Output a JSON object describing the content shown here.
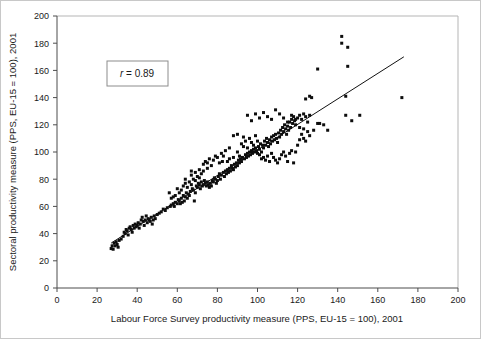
{
  "chart_data": {
    "type": "scatter",
    "title": "",
    "xlabel": "Labour Force Survey productivity measure (PPS, EU-15 = 100), 2001",
    "ylabel": "Sectoral productivity measure (PPS, EU-15 = 100), 2001",
    "xlim": [
      0,
      200
    ],
    "ylim": [
      0,
      200
    ],
    "xticks": [
      0,
      20,
      40,
      60,
      80,
      100,
      120,
      140,
      160,
      180,
      200
    ],
    "yticks": [
      0,
      20,
      40,
      60,
      80,
      100,
      120,
      140,
      160,
      180,
      200
    ],
    "grid": false,
    "legend": null,
    "annotations": [
      {
        "name": "correlation-box",
        "text": "r = 0.89",
        "italic_part": "r",
        "rest": " = 0.89",
        "x": 38,
        "y": 172
      }
    ],
    "marker": {
      "shape": "square",
      "size_px": 3,
      "color": "#0d0d0d"
    },
    "fit_line": {
      "type": "linear",
      "color": "#111111",
      "x_start": 27,
      "y_start": 33,
      "x_end": 173,
      "y_end": 170
    },
    "series": [
      {
        "name": "regions",
        "points": [
          [
            27,
            29
          ],
          [
            27.5,
            31
          ],
          [
            28,
            28.5
          ],
          [
            28.5,
            33
          ],
          [
            29,
            31
          ],
          [
            29.5,
            34
          ],
          [
            30,
            32
          ],
          [
            30.5,
            30
          ],
          [
            31,
            35
          ],
          [
            32,
            36
          ],
          [
            33,
            38
          ],
          [
            33.5,
            41
          ],
          [
            34,
            40
          ],
          [
            34.5,
            43
          ],
          [
            35,
            42
          ],
          [
            35.5,
            39
          ],
          [
            36,
            44
          ],
          [
            36.5,
            45
          ],
          [
            37,
            43
          ],
          [
            37.5,
            41
          ],
          [
            38,
            46
          ],
          [
            38.5,
            44
          ],
          [
            39,
            47
          ],
          [
            39.5,
            45
          ],
          [
            40,
            46
          ],
          [
            40.5,
            48
          ],
          [
            41,
            44
          ],
          [
            41.5,
            47
          ],
          [
            42,
            50
          ],
          [
            42.5,
            52
          ],
          [
            43,
            49
          ],
          [
            43.5,
            46
          ],
          [
            44,
            50
          ],
          [
            44.5,
            53
          ],
          [
            45,
            48
          ],
          [
            45.5,
            51
          ],
          [
            46,
            50
          ],
          [
            46.5,
            49
          ],
          [
            47,
            52
          ],
          [
            47.5,
            47
          ],
          [
            48,
            50
          ],
          [
            48.5,
            53
          ],
          [
            49,
            51
          ],
          [
            50,
            54
          ],
          [
            51,
            55
          ],
          [
            52,
            56
          ],
          [
            53,
            58
          ],
          [
            54,
            57
          ],
          [
            55,
            59
          ],
          [
            56,
            70
          ],
          [
            56.5,
            60
          ],
          [
            57,
            61
          ],
          [
            58,
            62
          ],
          [
            58.5,
            60
          ],
          [
            59,
            63
          ],
          [
            60,
            62
          ],
          [
            60.5,
            65
          ],
          [
            61,
            64
          ],
          [
            61.5,
            62
          ],
          [
            62,
            66
          ],
          [
            62.5,
            63
          ],
          [
            63,
            68
          ],
          [
            63.5,
            64
          ],
          [
            64,
            67
          ],
          [
            64.5,
            70
          ],
          [
            65,
            66
          ],
          [
            65.5,
            69
          ],
          [
            66,
            68
          ],
          [
            66.5,
            71
          ],
          [
            67,
            86
          ],
          [
            67.5,
            73
          ],
          [
            68,
            72
          ],
          [
            68.5,
            64
          ],
          [
            69,
            70
          ],
          [
            69.5,
            75
          ],
          [
            70,
            74
          ],
          [
            70.5,
            77
          ],
          [
            71,
            76
          ],
          [
            71.5,
            73
          ],
          [
            72,
            78
          ],
          [
            72.5,
            75
          ],
          [
            73,
            76
          ],
          [
            73.5,
            79
          ],
          [
            74,
            77
          ],
          [
            74.5,
            75
          ],
          [
            75,
            78
          ],
          [
            75.5,
            76
          ],
          [
            76,
            74
          ],
          [
            76.5,
            77
          ],
          [
            77,
            75
          ],
          [
            77.5,
            79
          ],
          [
            78,
            78
          ],
          [
            78.5,
            81
          ],
          [
            79,
            80
          ],
          [
            79.5,
            77
          ],
          [
            80,
            79
          ],
          [
            80.5,
            82
          ],
          [
            81,
            84
          ],
          [
            81.5,
            80
          ],
          [
            82,
            83
          ],
          [
            82.5,
            93
          ],
          [
            83,
            85
          ],
          [
            83.5,
            82
          ],
          [
            84,
            86
          ],
          [
            84.5,
            84
          ],
          [
            85,
            87
          ],
          [
            85.5,
            85
          ],
          [
            86,
            88
          ],
          [
            86.5,
            86
          ],
          [
            87,
            90
          ],
          [
            87.5,
            88
          ],
          [
            88,
            87
          ],
          [
            88.5,
            91
          ],
          [
            89,
            89
          ],
          [
            89.5,
            92
          ],
          [
            90,
            90
          ],
          [
            90.5,
            94
          ],
          [
            91,
            92
          ],
          [
            91.5,
            95
          ],
          [
            92,
            93
          ],
          [
            92.5,
            96
          ],
          [
            93,
            111
          ],
          [
            93.5,
            95
          ],
          [
            94,
            98
          ],
          [
            94.5,
            96
          ],
          [
            95,
            99
          ],
          [
            95.5,
            97
          ],
          [
            96,
            100
          ],
          [
            96.5,
            98
          ],
          [
            97,
            101
          ],
          [
            97.5,
            99
          ],
          [
            98,
            102
          ],
          [
            98.5,
            100
          ],
          [
            99,
            103
          ],
          [
            99.5,
            101
          ],
          [
            100,
            99
          ],
          [
            100.5,
            104
          ],
          [
            101,
            102
          ],
          [
            101.5,
            106
          ],
          [
            102,
            100
          ],
          [
            102.5,
            105
          ],
          [
            103,
            103
          ],
          [
            103.5,
            108
          ],
          [
            104,
            105
          ],
          [
            104.5,
            110
          ],
          [
            105,
            107
          ],
          [
            105.5,
            104
          ],
          [
            106,
            109
          ],
          [
            106.5,
            106
          ],
          [
            107,
            111
          ],
          [
            107.5,
            108
          ],
          [
            108,
            112
          ],
          [
            108.5,
            109
          ],
          [
            109,
            113
          ],
          [
            109.5,
            110
          ],
          [
            110,
            107
          ],
          [
            110.5,
            114
          ],
          [
            111,
            111
          ],
          [
            111.5,
            116
          ],
          [
            112,
            113
          ],
          [
            112.5,
            118
          ],
          [
            113,
            115
          ],
          [
            113.5,
            120
          ],
          [
            114,
            117
          ],
          [
            114.5,
            113
          ],
          [
            115,
            119
          ],
          [
            115.5,
            116
          ],
          [
            116,
            122
          ],
          [
            116.5,
            118
          ],
          [
            117,
            124
          ],
          [
            117.5,
            121
          ],
          [
            118,
            126
          ],
          [
            118.5,
            123
          ],
          [
            119,
            120
          ],
          [
            120,
            125
          ],
          [
            121,
            127
          ],
          [
            122,
            124
          ],
          [
            123,
            128
          ],
          [
            124,
            126
          ],
          [
            125,
            122
          ],
          [
            126,
            127
          ],
          [
            127,
            140
          ],
          [
            73,
            91
          ],
          [
            74,
            93
          ],
          [
            75,
            92
          ],
          [
            76,
            95
          ],
          [
            78,
            94
          ],
          [
            80,
            96
          ],
          [
            81,
            92
          ],
          [
            83,
            97
          ],
          [
            85,
            93
          ],
          [
            86,
            95
          ],
          [
            88,
            96
          ],
          [
            90,
            100
          ],
          [
            91,
            97
          ],
          [
            66,
            78
          ],
          [
            67,
            76
          ],
          [
            68,
            80
          ],
          [
            69,
            79
          ],
          [
            70,
            82
          ],
          [
            71,
            81
          ],
          [
            72,
            84
          ],
          [
            60,
            73
          ],
          [
            61,
            70
          ],
          [
            62,
            72
          ],
          [
            63,
            75
          ],
          [
            59,
            68
          ],
          [
            58,
            67
          ],
          [
            57,
            66
          ],
          [
            64,
            77
          ],
          [
            65,
            74
          ],
          [
            92,
            106
          ],
          [
            93,
            104
          ],
          [
            94,
            108
          ],
          [
            95,
            103
          ],
          [
            96,
            110
          ],
          [
            97,
            107
          ],
          [
            98,
            105
          ],
          [
            99,
            112
          ],
          [
            100,
            108
          ],
          [
            101,
            98
          ],
          [
            102,
            95
          ],
          [
            103,
            96
          ],
          [
            104,
            94
          ],
          [
            105,
            97
          ],
          [
            106,
            93
          ],
          [
            107,
            99
          ],
          [
            108,
            96
          ],
          [
            109,
            94
          ],
          [
            110,
            92
          ],
          [
            111,
            95
          ],
          [
            112,
            98
          ],
          [
            113,
            100
          ],
          [
            114,
            97
          ],
          [
            115,
            93
          ],
          [
            116,
            99
          ],
          [
            117,
            101
          ],
          [
            118,
            92
          ],
          [
            119,
            100
          ],
          [
            120,
            105
          ],
          [
            121,
            109
          ],
          [
            122,
            113
          ],
          [
            123,
            110
          ],
          [
            124,
            108
          ],
          [
            125,
            115
          ],
          [
            126,
            112
          ],
          [
            95,
            127
          ],
          [
            97,
            123
          ],
          [
            99,
            128
          ],
          [
            101,
            125
          ],
          [
            103,
            129
          ],
          [
            105,
            126
          ],
          [
            107,
            124
          ],
          [
            109,
            131
          ],
          [
            111,
            128
          ],
          [
            113,
            125
          ],
          [
            115,
            122
          ],
          [
            117,
            127
          ],
          [
            119,
            124
          ],
          [
            121,
            118
          ],
          [
            123,
            117
          ],
          [
            124,
            139
          ],
          [
            126,
            141
          ],
          [
            128,
            116
          ],
          [
            130,
            121
          ],
          [
            131,
            121
          ],
          [
            133,
            120
          ],
          [
            135,
            116
          ],
          [
            130,
            161
          ],
          [
            142,
            185
          ],
          [
            142,
            180
          ],
          [
            145,
            177
          ],
          [
            145,
            163
          ],
          [
            144,
            141
          ],
          [
            144,
            127
          ],
          [
            151,
            127
          ],
          [
            147,
            123
          ],
          [
            172,
            140
          ],
          [
            88,
            112
          ],
          [
            90,
            113
          ],
          [
            86,
            103
          ],
          [
            84,
            101
          ],
          [
            82,
            99
          ],
          [
            79,
            97
          ],
          [
            77,
            90
          ],
          [
            75,
            88
          ],
          [
            73,
            86
          ],
          [
            71,
            87
          ],
          [
            69,
            85
          ],
          [
            67,
            83
          ],
          [
            64,
            80
          ]
        ]
      }
    ]
  }
}
